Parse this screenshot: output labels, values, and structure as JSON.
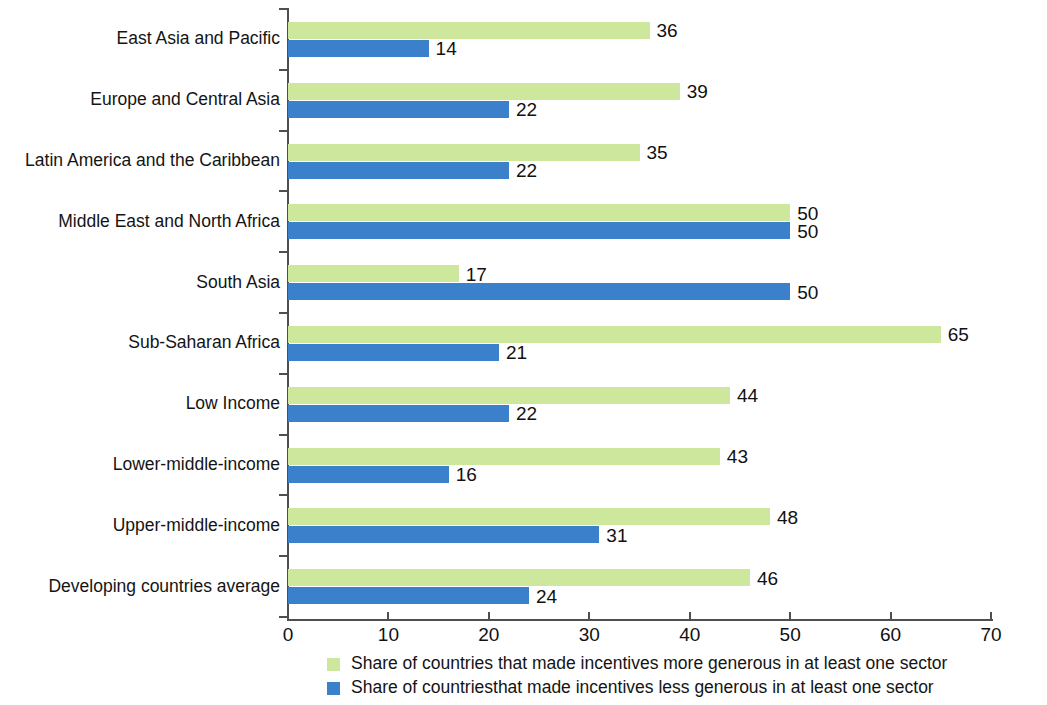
{
  "chart_data": {
    "type": "bar",
    "orientation": "horizontal",
    "title": "",
    "subtitle": "",
    "xlabel": "",
    "ylabel": "",
    "xlim": [
      0,
      70
    ],
    "xticks": [
      0,
      10,
      20,
      30,
      40,
      50,
      60,
      70
    ],
    "xtick_labels": [
      "0",
      "10",
      "20",
      "30",
      "40",
      "50",
      "60",
      "70"
    ],
    "grid": false,
    "legend_position": "bottom",
    "categories": [
      "East Asia and Pacific",
      "Europe and Central Asia",
      "Latin America and the Caribbean",
      "Middle East and North Africa",
      "South Asia",
      "Sub-Saharan Africa",
      "Low Income",
      "Lower-middle-income",
      "Upper-middle-income",
      "Developing countries average"
    ],
    "series": [
      {
        "name": "Share of countries that made incentives more generous in at least one sector",
        "key": "more",
        "color": "#cde89c",
        "values": [
          36,
          39,
          35,
          50,
          17,
          65,
          44,
          43,
          48,
          46
        ],
        "value_labels": [
          "36",
          "39",
          "35",
          "50",
          "17",
          "65",
          "44",
          "43",
          "48",
          "46"
        ]
      },
      {
        "name": "Share of countriesthat made incentives less generous in at least one sector",
        "key": "less",
        "color": "#3b80cb",
        "values": [
          14,
          22,
          22,
          50,
          50,
          21,
          22,
          16,
          31,
          24
        ],
        "value_labels": [
          "14",
          "22",
          "22",
          "50",
          "50",
          "21",
          "22",
          "16",
          "31",
          "24"
        ]
      }
    ]
  },
  "legend": {
    "items": [
      {
        "label": "Share of countries that made incentives more generous in at least one sector",
        "color": "#cde89c",
        "swatch": "legend-swatch-more"
      },
      {
        "label": "Share of countriesthat made incentives less generous in at least one sector",
        "color": "#3b80cb",
        "swatch": "legend-swatch-less"
      }
    ]
  },
  "axis": {
    "color": "#4f4f4f"
  }
}
